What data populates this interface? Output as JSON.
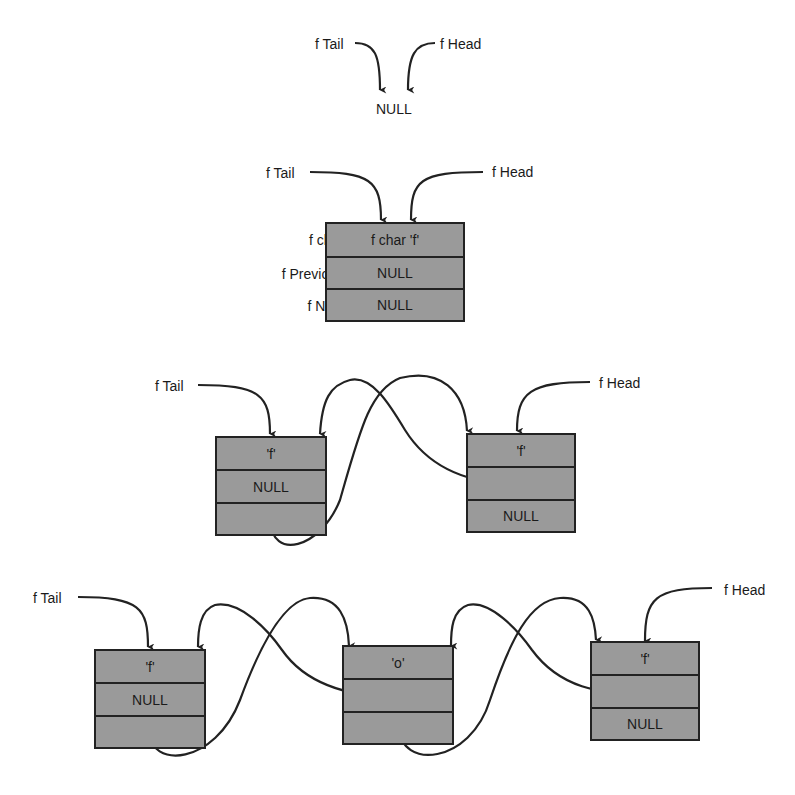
{
  "colors": {
    "node_fill": "#9a9a9a",
    "line": "#222222",
    "background": "#ffffff"
  },
  "stage1": {
    "tail_label": "f Tail",
    "head_label": "f Head",
    "null_label": "NULL"
  },
  "stage2": {
    "tail_label": "f Tail",
    "head_label": "f Head",
    "field_labels": [
      "f char",
      "f Previous",
      "f Next"
    ],
    "node": {
      "char": "f char  'f'",
      "previous": "NULL",
      "next": "NULL"
    }
  },
  "stage3": {
    "tail_label": "f Tail",
    "head_label": "f Head",
    "nodes": [
      {
        "char": "'f'",
        "previous": "NULL",
        "next": "pointer"
      },
      {
        "char": "'f'",
        "previous": "pointer",
        "next": "NULL"
      }
    ]
  },
  "stage4": {
    "tail_label": "f Tail",
    "head_label": "f Head",
    "nodes": [
      {
        "char": "'f'",
        "previous": "NULL",
        "next": "pointer"
      },
      {
        "char": "'o'",
        "previous": "pointer",
        "next": "pointer"
      },
      {
        "char": "'f'",
        "previous": "pointer",
        "next": "NULL"
      }
    ]
  }
}
